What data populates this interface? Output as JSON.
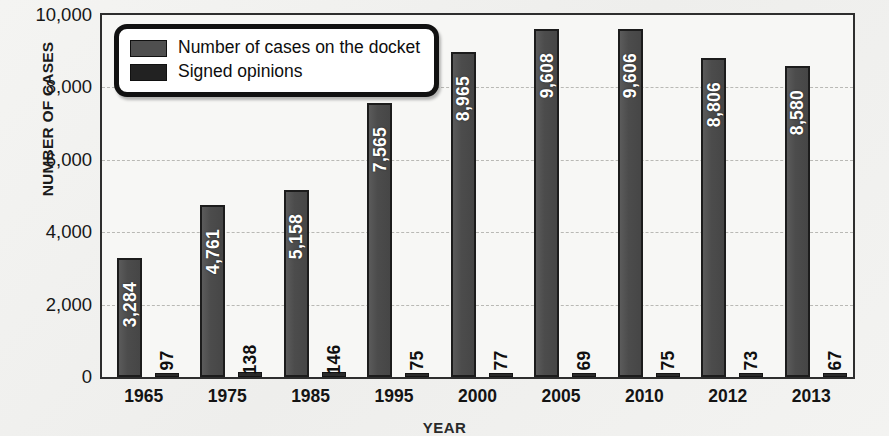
{
  "chart_data": {
    "type": "bar",
    "title": "",
    "xlabel": "YEAR",
    "ylabel": "NUMBER OF CASES",
    "categories": [
      "1965",
      "1975",
      "1985",
      "1995",
      "2000",
      "2005",
      "2010",
      "2012",
      "2013"
    ],
    "series": [
      {
        "name": "Number of cases on the docket",
        "color": "#4c4c4c",
        "values": [
          3284,
          4761,
          5158,
          7565,
          8965,
          9608,
          9606,
          8806,
          8580
        ],
        "labels": [
          "3,284",
          "4,761",
          "5,158",
          "7,565",
          "8,965",
          "9,608",
          "9,606",
          "8,806",
          "8,580"
        ]
      },
      {
        "name": "Signed opinions",
        "color": "#2a2a2a",
        "values": [
          97,
          138,
          146,
          75,
          77,
          69,
          75,
          73,
          67
        ],
        "labels": [
          "97",
          "138",
          "146",
          "75",
          "77",
          "69",
          "75",
          "73",
          "67"
        ]
      }
    ],
    "ylim": [
      0,
      10000
    ],
    "yticks": [
      0,
      2000,
      4000,
      6000,
      8000,
      10000
    ],
    "ytick_labels": [
      "0",
      "2,000",
      "4,000",
      "6,000",
      "8,000",
      "10,000"
    ],
    "grid": true,
    "legend_position": "top-left"
  },
  "legend": {
    "items": [
      {
        "label": "Number of cases on the docket"
      },
      {
        "label": "Signed opinions"
      }
    ]
  },
  "axes": {
    "y_title": "NUMBER OF CASES",
    "x_title": "YEAR"
  }
}
